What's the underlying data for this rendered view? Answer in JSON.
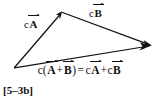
{
  "figure": {
    "tag": "[5–3b]",
    "background_color": "#ffffff",
    "stroke_color": "#111111",
    "labels": {
      "vector_a": {
        "scalar": "c",
        "vector": "A"
      },
      "vector_b": {
        "scalar": "c",
        "vector": "B"
      }
    },
    "equation": {
      "lhs_scalar": "c",
      "open_paren": "(",
      "term1": "A",
      "plus_inner": "+",
      "term2": "B",
      "close_paren": ")",
      "equals": "=",
      "rhs_scalar1": "c",
      "rhs_vector1": "A",
      "plus_outer": "+",
      "rhs_scalar2": "c",
      "rhs_vector2": "B",
      "plain_text": "c(A+B) = cA + cB"
    },
    "geometry": {
      "origin": [
        14,
        68
      ],
      "apex": [
        62,
        12
      ],
      "tip": [
        151,
        45.5
      ],
      "vectors": [
        {
          "name": "cA",
          "from": [
            14,
            68
          ],
          "to": [
            62,
            12
          ]
        },
        {
          "name": "cB",
          "from": [
            62,
            12
          ],
          "to": [
            151,
            45
          ]
        },
        {
          "name": "c(A+B)",
          "from": [
            14,
            68
          ],
          "to": [
            150,
            46
          ]
        }
      ]
    }
  }
}
